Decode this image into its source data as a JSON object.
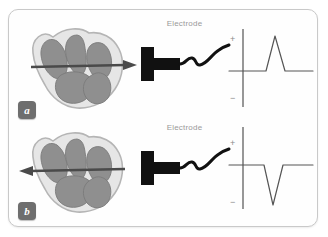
{
  "figure": {
    "background_color": "#ffffff",
    "frame_border_color": "#c9c9c9"
  },
  "colors": {
    "heart_wall": "#e6e6e6",
    "heart_chamber": "#8f8f8f",
    "heart_outline": "#b5b5b5",
    "arrow": "#4a4a4a",
    "electrode": "#111111",
    "wire": "#111111",
    "axis": "#7d7d7d",
    "trace": "#555555",
    "label_text": "#9a9a9a",
    "badge_bg": "#6e6e6e",
    "badge_text": "#ffffff"
  },
  "panels": [
    {
      "id": "a",
      "badge_label": "a",
      "electrode_label": "Electrode",
      "heart": {
        "name": "heart-cross-section",
        "chambers": 4
      },
      "vector": {
        "name": "depolarization-arrow",
        "direction": "right",
        "description": "toward electrode"
      },
      "electrode": {
        "name": "surface-electrode",
        "wire": "wavy-lead-wire"
      },
      "graph": {
        "axis_plus_label": "+",
        "axis_minus_label": "−",
        "deflection": "positive",
        "waveform": "upward triangular spike"
      }
    },
    {
      "id": "b",
      "badge_label": "b",
      "electrode_label": "Electrode",
      "heart": {
        "name": "heart-cross-section",
        "chambers": 4
      },
      "vector": {
        "name": "depolarization-arrow",
        "direction": "left",
        "description": "away from electrode"
      },
      "electrode": {
        "name": "surface-electrode",
        "wire": "wavy-lead-wire"
      },
      "graph": {
        "axis_plus_label": "+",
        "axis_minus_label": "−",
        "deflection": "negative",
        "waveform": "downward triangular spike"
      }
    }
  ]
}
